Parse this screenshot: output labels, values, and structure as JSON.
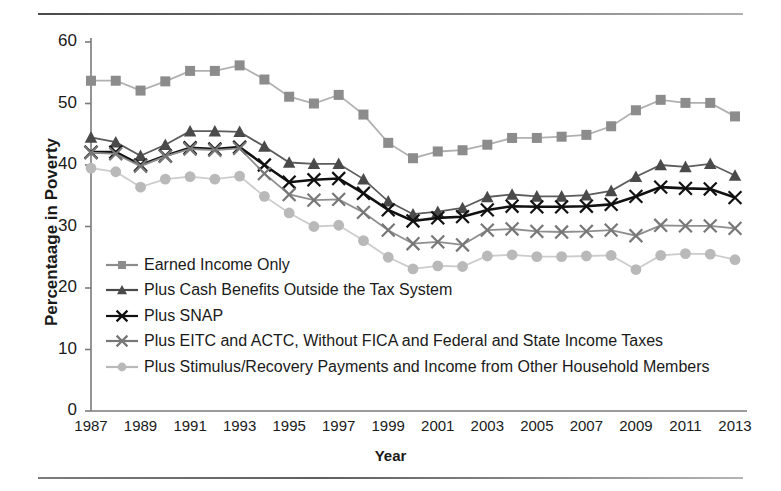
{
  "chart_data": {
    "type": "line",
    "title": "",
    "xlabel": "Year",
    "ylabel": "Percentaage in Poverty",
    "ylim": [
      0,
      60
    ],
    "yticks": [
      0,
      10,
      20,
      30,
      40,
      50,
      60
    ],
    "xlim": [
      1987,
      2013
    ],
    "xticks": [
      1987,
      1989,
      1991,
      1993,
      1995,
      1997,
      1999,
      2001,
      2003,
      2005,
      2007,
      2009,
      2011,
      2013
    ],
    "x": [
      1987,
      1988,
      1989,
      1990,
      1991,
      1992,
      1993,
      1994,
      1995,
      1996,
      1997,
      1998,
      1999,
      2000,
      2001,
      2002,
      2003,
      2004,
      2005,
      2006,
      2007,
      2008,
      2009,
      2010,
      2011,
      2012,
      2013
    ],
    "grid": false,
    "legend_position": "inside-lower-left",
    "series": [
      {
        "name": "Earned Income Only",
        "marker": "square",
        "color": "#8c8c8c",
        "line_color": "#b0b0b0",
        "values": [
          53.7,
          53.7,
          52.1,
          53.6,
          55.3,
          55.3,
          56.2,
          53.9,
          51.1,
          50.0,
          51.4,
          48.2,
          43.6,
          41.1,
          42.2,
          42.4,
          43.3,
          44.4,
          44.4,
          44.6,
          44.9,
          46.3,
          48.9,
          50.6,
          50.1,
          50.1,
          47.9
        ]
      },
      {
        "name": "Plus Cash Benefits Outside the Tax System",
        "marker": "triangle",
        "color": "#4a4a4a",
        "line_color": "#5c5c5c",
        "values": [
          44.5,
          43.7,
          41.5,
          43.3,
          45.5,
          45.5,
          45.4,
          43.0,
          40.4,
          40.2,
          40.2,
          37.7,
          34.1,
          32.0,
          32.4,
          33.0,
          34.8,
          35.2,
          34.9,
          34.9,
          35.1,
          35.8,
          38.1,
          40.0,
          39.7,
          40.2,
          38.3
        ]
      },
      {
        "name": "Plus SNAP",
        "marker": "x",
        "color": "#111111",
        "line_color": "#111111",
        "values": [
          42.1,
          42.1,
          40.0,
          41.5,
          42.8,
          42.6,
          42.9,
          40.0,
          37.2,
          37.6,
          37.8,
          35.4,
          32.7,
          30.9,
          31.4,
          31.6,
          32.7,
          33.3,
          33.2,
          33.2,
          33.3,
          33.6,
          34.9,
          36.4,
          36.2,
          36.1,
          34.7
        ]
      },
      {
        "name": "Plus EITC and ACTC, Without FICA and Federal and State Income Taxes",
        "marker": "x",
        "color": "#777777",
        "line_color": "#8e8e8e",
        "values": [
          42.0,
          41.8,
          39.8,
          41.4,
          42.6,
          42.4,
          42.7,
          38.6,
          35.2,
          34.3,
          34.4,
          32.3,
          29.4,
          27.2,
          27.5,
          27.0,
          29.4,
          29.6,
          29.2,
          29.1,
          29.2,
          29.4,
          28.5,
          30.2,
          30.1,
          30.1,
          29.7
        ]
      },
      {
        "name": "Plus Stimulus/Recovery Payments and Income from Other Household Members",
        "marker": "circle",
        "color": "#b9b9b9",
        "line_color": "#cccccc",
        "values": [
          39.5,
          38.9,
          36.4,
          37.7,
          38.1,
          37.7,
          38.2,
          34.9,
          32.2,
          30.0,
          30.2,
          27.7,
          25.0,
          23.1,
          23.6,
          23.5,
          25.2,
          25.4,
          25.1,
          25.1,
          25.2,
          25.3,
          23.0,
          25.3,
          25.6,
          25.5,
          24.6
        ]
      }
    ]
  },
  "axis": {
    "y_tick_labels": [
      "60",
      "50",
      "40",
      "30",
      "20",
      "10",
      "0"
    ],
    "x_tick_labels": [
      "1987",
      "1989",
      "1991",
      "1993",
      "1995",
      "1997",
      "1999",
      "2001",
      "2003",
      "2005",
      "2007",
      "2009",
      "2011",
      "2013"
    ],
    "y_axis_title": "Percentaage in Poverty",
    "x_axis_title": "Year"
  },
  "legend": {
    "items": [
      {
        "label": "Earned Income Only",
        "marker": "square-marker",
        "color": "#8c8c8c"
      },
      {
        "label": "Plus Cash Benefits Outside the Tax System",
        "marker": "triangle-marker",
        "color": "#4a4a4a"
      },
      {
        "label": "Plus SNAP",
        "marker": "x-marker",
        "color": "#111111"
      },
      {
        "label": "Plus EITC and ACTC, Without FICA and Federal and State Income Taxes",
        "marker": "x-marker",
        "color": "#777777"
      },
      {
        "label": "Plus Stimulus/Recovery Payments and Income from Other Household Members",
        "marker": "circle-marker",
        "color": "#b9b9b9"
      }
    ]
  }
}
